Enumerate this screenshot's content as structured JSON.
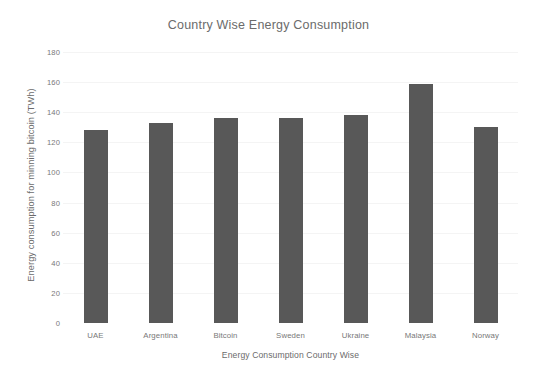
{
  "chart_data": {
    "type": "bar",
    "title": "Country Wise Energy Consumption",
    "xlabel": "Energy Consumption Country Wise",
    "ylabel": "Energy consumption  for minning bitcoin (TWh)",
    "categories": [
      "UAE",
      "Argentina",
      "Bitcoin",
      "Sweden",
      "Ukraine",
      "Malaysia",
      "Norway"
    ],
    "values": [
      128,
      133,
      136,
      136,
      138,
      159,
      130
    ],
    "ylim": [
      0,
      180
    ],
    "yticks": [
      0,
      20,
      40,
      60,
      80,
      100,
      120,
      140,
      160,
      180
    ],
    "ytick_labels": [
      "0",
      "20",
      "40",
      "60",
      "80",
      "100",
      "120",
      "140",
      "160",
      "180"
    ],
    "grid": true,
    "legend": null,
    "bar_color": "#585858",
    "background_color": "#ffffff",
    "text_color": "#6b6b6b"
  }
}
